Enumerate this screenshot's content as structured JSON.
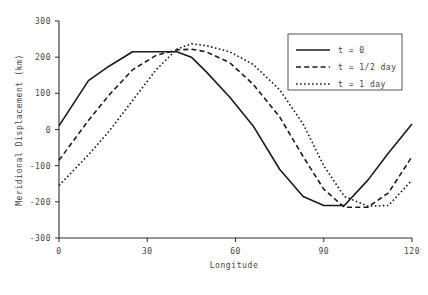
{
  "chart_data": {
    "type": "line",
    "title": "",
    "xlabel": "Longitude",
    "ylabel": "Meridional Displacement (km)",
    "xlim": [
      0,
      120
    ],
    "ylim": [
      -300,
      300
    ],
    "xticks": [
      0,
      30,
      60,
      90,
      120
    ],
    "yticks": [
      300,
      200,
      100,
      0,
      -100,
      -200,
      -300
    ],
    "xtick_labels": [
      "0",
      "30",
      "60",
      "90",
      "120"
    ],
    "ytick_labels": [
      "300",
      "200",
      "100",
      "0",
      "-100",
      "-200",
      "-300"
    ],
    "grid": false,
    "legend_position": "upper right",
    "series": [
      {
        "name": "t = 0",
        "style": "solid",
        "color": "#1a1a1a",
        "x": [
          0,
          10,
          17,
          25,
          33,
          40,
          45,
          50,
          58,
          66,
          75,
          83,
          90,
          97,
          105,
          112,
          120
        ],
        "values": [
          10,
          135,
          175,
          215,
          215,
          215,
          200,
          160,
          90,
          10,
          -110,
          -185,
          -210,
          -210,
          -140,
          -65,
          15
        ]
      },
      {
        "name": "t = 1/2 day",
        "style": "dashed",
        "color": "#1a1a1a",
        "x": [
          0,
          10,
          17,
          25,
          33,
          40,
          45,
          50,
          58,
          66,
          75,
          83,
          90,
          97,
          105,
          112,
          120
        ],
        "values": [
          -85,
          25,
          95,
          165,
          205,
          220,
          222,
          215,
          185,
          125,
          35,
          -75,
          -165,
          -215,
          -215,
          -175,
          -75
        ]
      },
      {
        "name": "t = 1 day",
        "style": "dotted",
        "color": "#1a1a1a",
        "x": [
          0,
          10,
          17,
          25,
          33,
          40,
          45,
          50,
          58,
          66,
          75,
          83,
          90,
          97,
          105,
          112,
          120
        ],
        "values": [
          -155,
          -70,
          -5,
          80,
          165,
          222,
          237,
          232,
          215,
          180,
          110,
          15,
          -100,
          -185,
          -212,
          -210,
          -140
        ]
      }
    ]
  },
  "legend": {
    "entries": [
      {
        "label": "t = 0",
        "style": "solid"
      },
      {
        "label": "t = 1/2 day",
        "style": "dashed"
      },
      {
        "label": "t = 1 day",
        "style": "dotted"
      }
    ]
  }
}
